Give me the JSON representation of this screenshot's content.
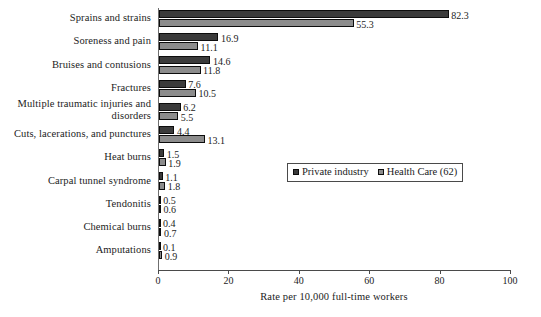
{
  "chart_data": {
    "type": "bar",
    "orientation": "horizontal",
    "grouped": true,
    "title": "",
    "xlabel": "Rate per 10,000 full-time workers",
    "ylabel": "",
    "xlim": [
      0,
      100
    ],
    "xticks": [
      0,
      20,
      40,
      60,
      80,
      100
    ],
    "xtick_labels": [
      "0",
      "20",
      "40",
      "60",
      "80",
      "100"
    ],
    "grid": false,
    "legend_position": "middle-right",
    "categories": [
      "Sprains and strains",
      "Soreness and pain",
      "Bruises and contusions",
      "Fractures",
      "Multiple traumatic injuries and disorders",
      "Cuts, lacerations, and punctures",
      "Heat burns",
      "Carpal tunnel syndrome",
      "Tendonitis",
      "Chemical burns",
      "Amputations"
    ],
    "series": [
      {
        "name": "Private industry",
        "color": "#3b3b3b",
        "values": [
          82.3,
          16.9,
          14.6,
          7.6,
          6.2,
          4.4,
          1.5,
          1.1,
          0.5,
          0.4,
          0.1
        ],
        "value_labels": [
          "82.3",
          "16.9",
          "14.6",
          "7.6",
          "6.2",
          "4.4",
          "1.5",
          "1.1",
          "0.5",
          "0.4",
          "0.1"
        ]
      },
      {
        "name": "Health Care (62)",
        "color": "#8c8c8c",
        "values": [
          55.3,
          11.1,
          11.8,
          10.5,
          5.5,
          13.1,
          1.9,
          1.8,
          0.6,
          0.7,
          0.9
        ],
        "value_labels": [
          "55.3",
          "11.1",
          "11.8",
          "10.5",
          "5.5",
          "13.1",
          "1.9",
          "1.8",
          "0.6",
          "0.7",
          "0.9"
        ]
      }
    ]
  },
  "legend": {
    "items": [
      {
        "label": "Private industry"
      },
      {
        "label": "Health Care (62)"
      }
    ]
  },
  "axis": {
    "x_title": "Rate per 10,000 full-time workers",
    "tick_labels": [
      "0",
      "20",
      "40",
      "60",
      "80",
      "100"
    ]
  },
  "category_labels": [
    "Sprains and strains",
    "Soreness and pain",
    "Bruises and contusions",
    "Fractures",
    "Multiple traumatic injuries and disorders",
    "Cuts, lacerations, and punctures",
    "Heat burns",
    "Carpal tunnel syndrome",
    "Tendonitis",
    "Chemical burns",
    "Amputations"
  ],
  "colors": {
    "series_private": "#3b3b3b",
    "series_health": "#8c8c8c",
    "axis": "#4a4a4a",
    "text": "#1c1c1c",
    "background": "#ffffff"
  }
}
